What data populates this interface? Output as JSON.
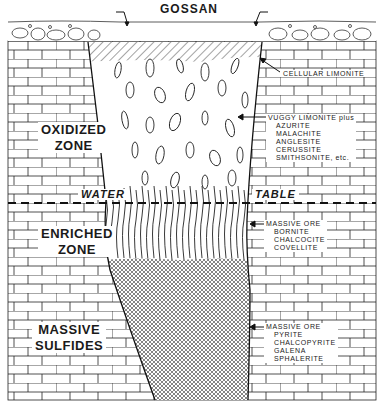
{
  "title": "GOSSAN",
  "zones": {
    "oxidized": {
      "line1": "OXIDIZED",
      "line2": "ZONE"
    },
    "enriched": {
      "line1": "ENRICHED",
      "line2": "ZONE"
    },
    "massive": {
      "line1": "MASSIVE",
      "line2": "SULFIDES"
    }
  },
  "water_table": {
    "left": "WATER",
    "right": "TABLE"
  },
  "annotations": {
    "cellular_limonite": "CELLULAR LIMONITE",
    "oxidized_minerals": {
      "header": "VUGGY LIMONITE plus",
      "items": [
        "AZURITE",
        "MALACHITE",
        "ANGLESITE",
        "CERUSSITE",
        "SMITHSONITE, etc."
      ]
    },
    "enriched_minerals": {
      "header": "MASSIVE ORE",
      "items": [
        "BORNITE",
        "CHALCOCITE",
        "COVELLITE"
      ]
    },
    "massive_minerals": {
      "header": "MASSIVE ORE",
      "items": [
        "PYRITE",
        "CHALCOPYRITE",
        "GALENA",
        "SPHALERITE"
      ]
    }
  },
  "colors": {
    "ink": "#1a1a1a",
    "paper": "#ffffff"
  }
}
